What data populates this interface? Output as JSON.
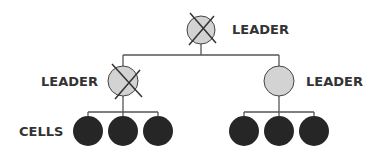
{
  "colors": {
    "line": "#555555",
    "leader_fill": "#d3d3d3",
    "leader_stroke": "#444444",
    "cell_fill": "#262626",
    "cross": "#333333",
    "label": "#333333"
  },
  "top_leader": {
    "label": "LEADER",
    "status": "eliminated"
  },
  "left_leader": {
    "label": "LEADER",
    "status": "eliminated"
  },
  "right_leader": {
    "label": "LEADER",
    "status": "active"
  },
  "cells_label": "CELLS",
  "left_cells": [
    "cell",
    "cell",
    "cell"
  ],
  "right_cells": [
    "cell",
    "cell",
    "cell"
  ]
}
